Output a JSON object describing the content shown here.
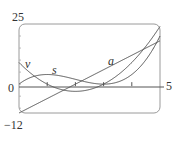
{
  "chart_data": {
    "type": "line",
    "title": "",
    "xlabel": "",
    "ylabel": "",
    "xlim": [
      0,
      5
    ],
    "ylim": [
      -12,
      25
    ],
    "x_ticks": [
      1,
      2,
      3,
      4
    ],
    "axis_labels": {
      "y_top": "25",
      "y_bottom": "−12",
      "origin": "0",
      "x_right": "5"
    },
    "grid": false,
    "series": [
      {
        "name": "s",
        "formula": "t^3 - 6t^2 + 9t",
        "x": [
          0,
          1,
          2,
          3,
          4,
          5
        ],
        "values": [
          0,
          4,
          2,
          0,
          4,
          20
        ]
      },
      {
        "name": "v",
        "formula": "3t^2 - 12t + 9",
        "x": [
          0,
          1,
          2,
          3,
          4,
          5
        ],
        "values": [
          9,
          0,
          -3,
          0,
          9,
          24
        ]
      },
      {
        "name": "a",
        "formula": "6t - 12",
        "x": [
          0,
          1,
          2,
          3,
          4,
          5
        ],
        "values": [
          -12,
          -6,
          0,
          6,
          12,
          18
        ]
      }
    ],
    "annotations": [
      {
        "text": "v",
        "x": 0.25,
        "y": 11
      },
      {
        "text": "s",
        "x": 1.2,
        "y": 6
      },
      {
        "text": "a",
        "x": 3.2,
        "y": 12
      }
    ]
  },
  "labels": {
    "y_top": "25",
    "y_bottom": "−12",
    "origin": "0",
    "x_right": "5",
    "v": "v",
    "s": "s",
    "a": "a"
  }
}
